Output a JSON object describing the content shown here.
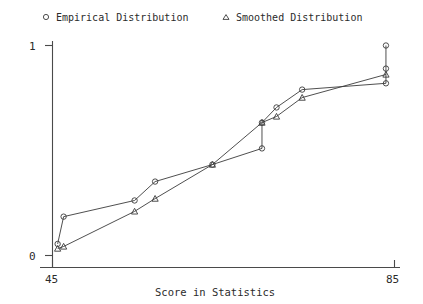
{
  "legend": {
    "position": "top",
    "entries": [
      {
        "label": "Empirical Distribution",
        "marker": "circle-marker-icon"
      },
      {
        "label": "Smoothed Distribution",
        "marker": "triangle-marker-icon"
      }
    ]
  },
  "axes": {
    "xlabel": "Score in Statistics",
    "ylabel": "",
    "xticks": [
      "45",
      "85"
    ],
    "yticks": [
      "0",
      "1"
    ],
    "xlim": [
      45,
      85
    ],
    "ylim": [
      0,
      1
    ]
  },
  "chart_data": {
    "type": "line",
    "title": "",
    "subtitle": "",
    "xlabel": "Score in Statistics",
    "ylabel": "",
    "xlim": [
      45,
      85
    ],
    "ylim": [
      0,
      1
    ],
    "xticks": [
      45,
      85
    ],
    "yticks": [
      0,
      1
    ],
    "grid": false,
    "legend_position": "top",
    "series": [
      {
        "name": "Empirical Distribution",
        "marker": "circle",
        "points": [
          {
            "x": 45.6,
            "y": 0.055
          },
          {
            "x": 46.3,
            "y": 0.185
          },
          {
            "x": 54.6,
            "y": 0.262
          },
          {
            "x": 57.0,
            "y": 0.352
          },
          {
            "x": 63.7,
            "y": 0.433
          },
          {
            "x": 69.5,
            "y": 0.51
          },
          {
            "x": 69.5,
            "y": 0.633
          },
          {
            "x": 71.2,
            "y": 0.705
          },
          {
            "x": 74.2,
            "y": 0.79
          },
          {
            "x": 84.0,
            "y": 0.82
          },
          {
            "x": 84.0,
            "y": 0.89
          },
          {
            "x": 84.0,
            "y": 1.0
          }
        ]
      },
      {
        "name": "Smoothed Distribution",
        "marker": "triangle",
        "points": [
          {
            "x": 45.6,
            "y": 0.033
          },
          {
            "x": 46.3,
            "y": 0.043
          },
          {
            "x": 54.6,
            "y": 0.21
          },
          {
            "x": 57.0,
            "y": 0.271
          },
          {
            "x": 63.7,
            "y": 0.433
          },
          {
            "x": 69.5,
            "y": 0.633
          },
          {
            "x": 71.2,
            "y": 0.662
          },
          {
            "x": 74.2,
            "y": 0.752
          },
          {
            "x": 84.0,
            "y": 0.862
          }
        ]
      }
    ]
  },
  "style": {
    "line_color": "#3b3b3b",
    "axis_color": "#4a4a4a",
    "text_color": "#2b2b2b",
    "background": "#ffffff"
  }
}
